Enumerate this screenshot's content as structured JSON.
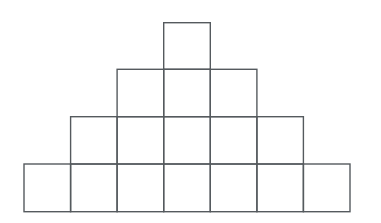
{
  "figure": {
    "background_color": "#ffffff",
    "stroke_color": "#555a5e",
    "stroke_width": 1.4,
    "canvas": {
      "width": 381,
      "height": 223
    },
    "grid": {
      "origin_x": 24,
      "origin_y": 22.7,
      "cell_width": 46.57,
      "cell_height": 47.25,
      "columns": 7,
      "rows": 4,
      "column_x": [
        24,
        70.6,
        117.1,
        163.7,
        210.3,
        256.9,
        303.4,
        350
      ],
      "row_y": [
        22.7,
        69.3,
        116.7,
        164,
        211.7
      ]
    },
    "rows": [
      {
        "index": 0,
        "label": "row-1-top",
        "count": 1,
        "start_column": 3,
        "squares": [
          {
            "col": 3,
            "row": 0
          }
        ]
      },
      {
        "index": 1,
        "label": "row-2",
        "count": 3,
        "start_column": 2,
        "squares": [
          {
            "col": 2,
            "row": 1
          },
          {
            "col": 3,
            "row": 1
          },
          {
            "col": 4,
            "row": 1
          }
        ]
      },
      {
        "index": 2,
        "label": "row-3",
        "count": 5,
        "start_column": 1,
        "squares": [
          {
            "col": 1,
            "row": 2
          },
          {
            "col": 2,
            "row": 2
          },
          {
            "col": 3,
            "row": 2
          },
          {
            "col": 4,
            "row": 2
          },
          {
            "col": 5,
            "row": 2
          }
        ]
      },
      {
        "index": 3,
        "label": "row-4-base",
        "count": 7,
        "start_column": 0,
        "squares": [
          {
            "col": 0,
            "row": 3
          },
          {
            "col": 1,
            "row": 3
          },
          {
            "col": 2,
            "row": 3
          },
          {
            "col": 3,
            "row": 3
          },
          {
            "col": 4,
            "row": 3
          },
          {
            "col": 5,
            "row": 3
          },
          {
            "col": 6,
            "row": 3
          }
        ]
      }
    ],
    "total_squares": 16
  },
  "chart_data": {
    "type": "bar",
    "categories": [
      "row-1-top",
      "row-2",
      "row-3",
      "row-4-base"
    ],
    "values": [
      1,
      3,
      5,
      7
    ],
    "xlabel": "",
    "ylabel": "squares per row",
    "ylim": [
      0,
      7
    ],
    "grid": false,
    "legend": "none",
    "annotations": []
  }
}
